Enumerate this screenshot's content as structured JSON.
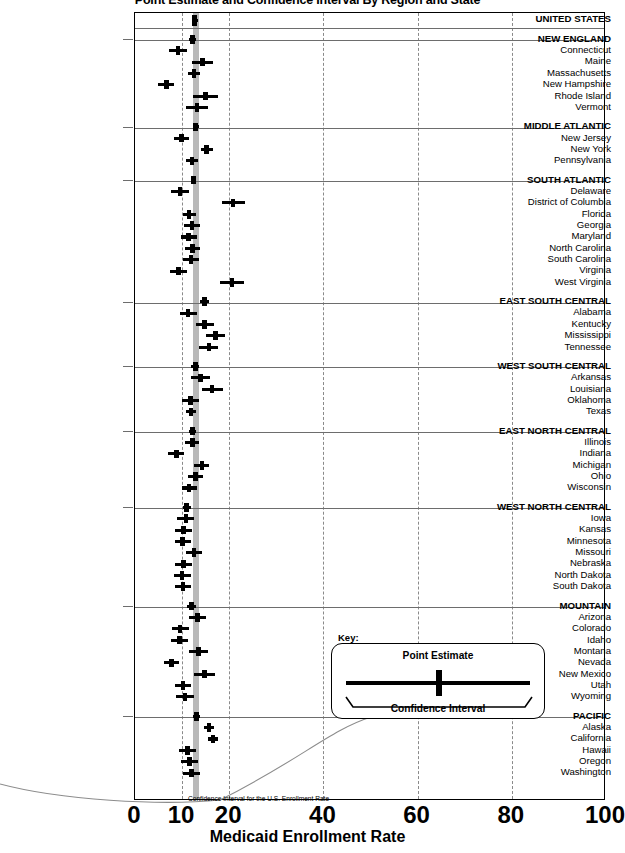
{
  "chart_data": {
    "type": "scatter",
    "title": "Point Estimate and Confidence Interval By Region and State",
    "xlabel": "Medicaid Enrollment Rate",
    "ylabel": "",
    "xlim": [
      0,
      100
    ],
    "xticks": [
      0,
      10,
      20,
      40,
      60,
      80,
      100
    ],
    "xticklabels": [
      "0",
      "10",
      "20",
      "40",
      "60",
      "80",
      "100"
    ],
    "gridlines_x": [
      10,
      20,
      40,
      60,
      80
    ],
    "grid": true,
    "legend_position": "inside-right",
    "us_reference_band": {
      "label": "Confidence Interval for the U.S. Enrollment Rate",
      "low": 12.3,
      "high": 13.5
    },
    "rows": [
      {
        "label": "UNITED STATES",
        "kind": "total",
        "estimate": 12.9,
        "low": 12.3,
        "high": 13.5
      },
      {
        "label": "NEW ENGLAND",
        "kind": "region",
        "estimate": 12.4,
        "low": 11.6,
        "high": 13.2
      },
      {
        "label": "Connecticut",
        "kind": "state",
        "estimate": 9.3,
        "low": 7.5,
        "high": 11.2
      },
      {
        "label": "Maine",
        "kind": "state",
        "estimate": 14.6,
        "low": 12.4,
        "high": 16.8
      },
      {
        "label": "Massachusetts",
        "kind": "state",
        "estimate": 12.7,
        "low": 11.5,
        "high": 14.0
      },
      {
        "label": "New Hampshire",
        "kind": "state",
        "estimate": 6.9,
        "low": 5.2,
        "high": 8.6
      },
      {
        "label": "Rhode Island",
        "kind": "state",
        "estimate": 15.2,
        "low": 12.6,
        "high": 17.8
      },
      {
        "label": "Vermont",
        "kind": "state",
        "estimate": 13.4,
        "low": 11.1,
        "high": 15.7
      },
      {
        "label": "MIDDLE ATLANTIC",
        "kind": "region",
        "estimate": 13.1,
        "low": 12.5,
        "high": 13.7
      },
      {
        "label": "New Jersey",
        "kind": "state",
        "estimate": 10.1,
        "low": 8.5,
        "high": 11.7
      },
      {
        "label": "New York",
        "kind": "state",
        "estimate": 15.4,
        "low": 14.2,
        "high": 16.7
      },
      {
        "label": "Pennsylvania",
        "kind": "state",
        "estimate": 12.3,
        "low": 11.0,
        "high": 13.6
      },
      {
        "label": "SOUTH ATLANTIC",
        "kind": "region",
        "estimate": 12.6,
        "low": 12.0,
        "high": 13.2
      },
      {
        "label": "Delaware",
        "kind": "state",
        "estimate": 9.8,
        "low": 7.9,
        "high": 11.7
      },
      {
        "label": "District of Columbia",
        "kind": "state",
        "estimate": 21.0,
        "low": 18.6,
        "high": 23.5
      },
      {
        "label": "Florida",
        "kind": "state",
        "estimate": 11.7,
        "low": 10.4,
        "high": 13.1
      },
      {
        "label": "Georgia",
        "kind": "state",
        "estimate": 12.3,
        "low": 10.6,
        "high": 14.0
      },
      {
        "label": "Maryland",
        "kind": "state",
        "estimate": 11.6,
        "low": 9.9,
        "high": 13.3
      },
      {
        "label": "North Carolina",
        "kind": "state",
        "estimate": 12.4,
        "low": 10.8,
        "high": 14.0
      },
      {
        "label": "South Carolina",
        "kind": "state",
        "estimate": 12.1,
        "low": 10.3,
        "high": 13.9
      },
      {
        "label": "Virginia",
        "kind": "state",
        "estimate": 9.4,
        "low": 7.6,
        "high": 11.2
      },
      {
        "label": "West Virginia",
        "kind": "state",
        "estimate": 20.8,
        "low": 18.3,
        "high": 23.3
      },
      {
        "label": "EAST SOUTH CENTRAL",
        "kind": "region",
        "estimate": 15.0,
        "low": 14.0,
        "high": 16.0
      },
      {
        "label": "Alabama",
        "kind": "state",
        "estimate": 11.5,
        "low": 9.7,
        "high": 13.3
      },
      {
        "label": "Kentucky",
        "kind": "state",
        "estimate": 15.0,
        "low": 13.1,
        "high": 16.9
      },
      {
        "label": "Mississippi",
        "kind": "state",
        "estimate": 17.3,
        "low": 15.3,
        "high": 19.3
      },
      {
        "label": "Tennessee",
        "kind": "state",
        "estimate": 15.9,
        "low": 13.9,
        "high": 17.9
      },
      {
        "label": "WEST SOUTH CENTRAL",
        "kind": "region",
        "estimate": 13.0,
        "low": 12.2,
        "high": 13.8
      },
      {
        "label": "Arkansas",
        "kind": "state",
        "estimate": 14.1,
        "low": 12.1,
        "high": 16.1
      },
      {
        "label": "Louisiana",
        "kind": "state",
        "estimate": 16.6,
        "low": 14.4,
        "high": 18.8
      },
      {
        "label": "Oklahoma",
        "kind": "state",
        "estimate": 12.0,
        "low": 10.2,
        "high": 13.8
      },
      {
        "label": "Texas",
        "kind": "state",
        "estimate": 12.1,
        "low": 11.0,
        "high": 13.2
      },
      {
        "label": "EAST NORTH CENTRAL",
        "kind": "region",
        "estimate": 12.4,
        "low": 11.7,
        "high": 13.1
      },
      {
        "label": "Illinois",
        "kind": "state",
        "estimate": 12.4,
        "low": 10.9,
        "high": 13.9
      },
      {
        "label": "Indiana",
        "kind": "state",
        "estimate": 9.0,
        "low": 7.3,
        "high": 10.7
      },
      {
        "label": "Michigan",
        "kind": "state",
        "estimate": 14.4,
        "low": 12.8,
        "high": 16.0
      },
      {
        "label": "Ohio",
        "kind": "state",
        "estimate": 13.1,
        "low": 11.5,
        "high": 14.7
      },
      {
        "label": "Wisconsin",
        "kind": "state",
        "estimate": 11.7,
        "low": 10.1,
        "high": 13.3
      },
      {
        "label": "WEST NORTH CENTRAL",
        "kind": "region",
        "estimate": 11.2,
        "low": 10.3,
        "high": 12.1
      },
      {
        "label": "Iowa",
        "kind": "state",
        "estimate": 11.0,
        "low": 9.2,
        "high": 12.8
      },
      {
        "label": "Kansas",
        "kind": "state",
        "estimate": 10.5,
        "low": 8.7,
        "high": 12.3
      },
      {
        "label": "Minnesota",
        "kind": "state",
        "estimate": 10.3,
        "low": 8.6,
        "high": 12.0
      },
      {
        "label": "Missouri",
        "kind": "state",
        "estimate": 12.7,
        "low": 11.0,
        "high": 14.4
      },
      {
        "label": "Nebraska",
        "kind": "state",
        "estimate": 10.5,
        "low": 8.7,
        "high": 12.3
      },
      {
        "label": "North Dakota",
        "kind": "state",
        "estimate": 10.2,
        "low": 8.4,
        "high": 12.0
      },
      {
        "label": "South Dakota",
        "kind": "state",
        "estimate": 10.4,
        "low": 8.6,
        "high": 12.2
      },
      {
        "label": "MOUNTAIN",
        "kind": "region",
        "estimate": 12.2,
        "low": 11.3,
        "high": 13.1
      },
      {
        "label": "Arizona",
        "kind": "state",
        "estimate": 13.5,
        "low": 11.7,
        "high": 15.3
      },
      {
        "label": "Colorado",
        "kind": "state",
        "estimate": 9.8,
        "low": 8.0,
        "high": 11.6
      },
      {
        "label": "Idaho",
        "kind": "state",
        "estimate": 9.6,
        "low": 7.8,
        "high": 11.4
      },
      {
        "label": "Montana",
        "kind": "state",
        "estimate": 13.7,
        "low": 11.7,
        "high": 15.7
      },
      {
        "label": "Nevada",
        "kind": "state",
        "estimate": 7.9,
        "low": 6.3,
        "high": 9.5
      },
      {
        "label": "New Mexico",
        "kind": "state",
        "estimate": 15.0,
        "low": 12.8,
        "high": 17.2
      },
      {
        "label": "Utah",
        "kind": "state",
        "estimate": 10.4,
        "low": 8.6,
        "high": 12.2
      },
      {
        "label": "Wyoming",
        "kind": "state",
        "estimate": 10.8,
        "low": 8.9,
        "high": 12.7
      },
      {
        "label": "PACIFIC",
        "kind": "region",
        "estimate": 13.3,
        "low": 12.5,
        "high": 14.1
      },
      {
        "label": "Alaska",
        "kind": "state",
        "estimate": 15.9,
        "low": 14.8,
        "high": 17.0
      },
      {
        "label": "California",
        "kind": "state",
        "estimate": 16.8,
        "low": 15.7,
        "high": 17.9
      },
      {
        "label": "Hawaii",
        "kind": "state",
        "estimate": 11.4,
        "low": 9.6,
        "high": 13.2
      },
      {
        "label": "Oregon",
        "kind": "state",
        "estimate": 11.8,
        "low": 10.0,
        "high": 13.6
      },
      {
        "label": "Washington",
        "kind": "state",
        "estimate": 12.2,
        "low": 10.4,
        "high": 14.0
      }
    ]
  },
  "key": {
    "title": "Key:",
    "point_estimate_label": "Point Estimate",
    "confidence_interval_label": "Confidence Interval"
  },
  "colors": {
    "marker": "#000000",
    "us_band": "#b9b9b9",
    "gridline": "#8a8a8a",
    "frame": "#000000"
  }
}
